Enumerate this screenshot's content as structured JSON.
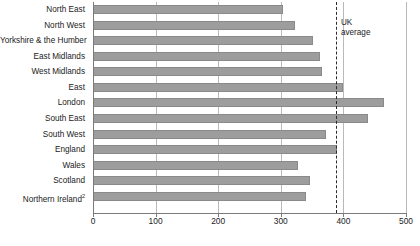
{
  "chart_data": {
    "type": "bar",
    "orientation": "horizontal",
    "title": "",
    "xlabel": "",
    "ylabel": "",
    "xlim": [
      0,
      500
    ],
    "xticks": [
      0,
      100,
      200,
      300,
      400,
      500
    ],
    "grid": true,
    "grid_axis": "x",
    "legend": false,
    "categories": [
      "North East",
      "North West",
      "Yorkshire & the Humber",
      "East Midlands",
      "West Midlands",
      "East",
      "London",
      "South East",
      "South West",
      "England",
      "Wales",
      "Scotland",
      "Northern Ireland"
    ],
    "category_footnotes": {
      "Northern Ireland": "2"
    },
    "values": [
      303,
      323,
      352,
      362,
      366,
      400,
      465,
      440,
      372,
      390,
      327,
      347,
      340
    ],
    "annotations": [
      {
        "type": "reference-line",
        "label": "UK average",
        "label_lines": [
          "UK",
          "average"
        ],
        "value": 388,
        "style": "dashed"
      }
    ],
    "bar_color": "#9d9d9d",
    "bar_border_color": "#8a8a8a",
    "gridline_color": "#b9b9b9",
    "axis_color": "#7b7b7b",
    "text_color": "#1b1b1b",
    "background": "#ffffff"
  }
}
